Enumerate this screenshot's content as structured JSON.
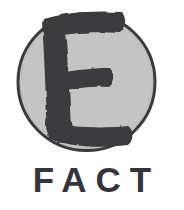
{
  "logo": {
    "name": "E FACT logo",
    "emblem": {
      "letter": "E",
      "shape": "circle",
      "circle_fill": "#c9c9c9",
      "circle_stroke": "#3c3c40",
      "letter_color": "#3a3a3e",
      "center_x": 86,
      "center_y": 82,
      "radius": 69,
      "stroke_width": 3
    },
    "wordmark": {
      "text": "FACT",
      "color": "#34343a",
      "letters": [
        "F",
        "A",
        "C",
        "T"
      ]
    },
    "background_color": "#ffffff"
  }
}
